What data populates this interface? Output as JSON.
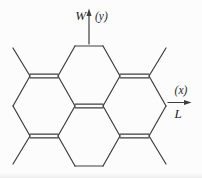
{
  "diagram": {
    "type": "structural-diagram",
    "background": "#fcfcfc",
    "stroke_color": "#3e3e3e",
    "text_color": "#262626",
    "axes": {
      "y": {
        "name": "W",
        "symbol": "(y)"
      },
      "x": {
        "name": "L",
        "symbol": "(x)"
      }
    },
    "bonds": {
      "single": [
        [
          75,
          46,
          103,
          46
        ],
        [
          75,
          46,
          58,
          76
        ],
        [
          103,
          46,
          120,
          76
        ],
        [
          58,
          76,
          75,
          106
        ],
        [
          120,
          76,
          103,
          106
        ],
        [
          30,
          76,
          13,
          106
        ],
        [
          13,
          106,
          30,
          136
        ],
        [
          75,
          106,
          58,
          136
        ],
        [
          103,
          106,
          120,
          136
        ],
        [
          149,
          76,
          166,
          106
        ],
        [
          166,
          106,
          149,
          136
        ],
        [
          58,
          136,
          75,
          166
        ],
        [
          120,
          136,
          103,
          166
        ],
        [
          75,
          166,
          103,
          166
        ]
      ],
      "double": [
        [
          30,
          76,
          58,
          76
        ],
        [
          120,
          76,
          149,
          76
        ],
        [
          75,
          106,
          103,
          106
        ],
        [
          30,
          136,
          58,
          136
        ],
        [
          120,
          136,
          149,
          136
        ]
      ],
      "double_gap": 3.6,
      "stubs": [
        [
          30,
          76,
          13,
          48
        ],
        [
          149,
          76,
          166,
          48
        ],
        [
          30,
          136,
          13,
          164
        ],
        [
          149,
          136,
          166,
          164
        ]
      ]
    },
    "arrows": {
      "y": {
        "x": 89,
        "y_from": 44,
        "y_to": 15,
        "tip_y": 8.5,
        "head_half_width": 2.5,
        "head_base_y": 16
      },
      "x": {
        "y": 102.5,
        "x_from": 168,
        "x_to": 184,
        "tip_x": 191.5,
        "head_half_width": 2.5,
        "head_base_x": 184
      }
    }
  }
}
